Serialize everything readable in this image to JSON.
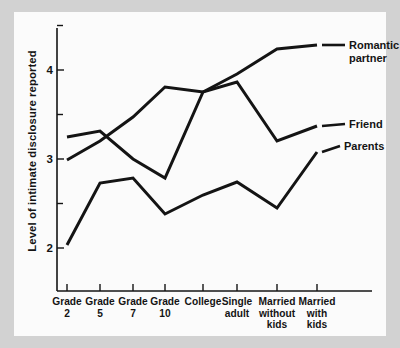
{
  "figure": {
    "background_color": "#d2d2d2",
    "plate_color": "#fbfbfb",
    "line_color": "#141414"
  },
  "chart_data": {
    "type": "line",
    "title": "",
    "xlabel": "",
    "ylabel": "Level of intimate disclosure reported",
    "categories": [
      "Grade 2",
      "Grade 5",
      "Grade 7",
      "Grade 10",
      "College",
      "Single adult",
      "Married without kids",
      "Married with kids"
    ],
    "category_lines": [
      [
        "Grade",
        "2"
      ],
      [
        "Grade",
        "5"
      ],
      [
        "Grade",
        "7"
      ],
      [
        "Grade",
        "10"
      ],
      [
        "College",
        ""
      ],
      [
        "Single",
        "adult"
      ],
      [
        "Married",
        "without",
        "kids"
      ],
      [
        "Married",
        "with",
        "kids"
      ]
    ],
    "ytick_labels": [
      "2",
      "3",
      "4"
    ],
    "ytick_values": [
      2,
      3,
      4
    ],
    "yminor_values": [
      2.5,
      3.5,
      4.5
    ],
    "ylim": [
      1.55,
      4.72
    ],
    "grid": false,
    "legend_position": "right-inline",
    "series": [
      {
        "name": "Romantic partner",
        "label_lines": [
          "Romantic",
          "partner"
        ],
        "values": [
          3.21,
          3.42,
          2.78,
          2.22,
          2.42,
          null,
          null,
          null
        ]
      },
      {
        "name": "Friend",
        "label_lines": [
          "Friend"
        ],
        "values": [
          2.85,
          3.22,
          3.55,
          3.78,
          3.7,
          3.85,
          3.17,
          3.45
        ]
      },
      {
        "name": "Parents",
        "label_lines": [
          "Parents"
        ],
        "values": [
          2.05,
          2.72,
          2.78,
          2.22,
          2.55,
          2.72,
          2.45,
          3.1
        ]
      }
    ],
    "series_paths": {
      "romantic_partner": [
        [
          67,
          137
        ],
        [
          100,
          131
        ],
        [
          133,
          159
        ],
        [
          165,
          178
        ],
        [
          203,
          92
        ],
        [
          237,
          74
        ],
        [
          277,
          49
        ],
        [
          317,
          45
        ]
      ],
      "friend": [
        [
          67,
          160
        ],
        [
          100,
          141
        ],
        [
          133,
          117
        ],
        [
          165,
          87
        ],
        [
          203,
          92
        ],
        [
          237,
          82
        ],
        [
          277,
          141
        ],
        [
          317,
          126
        ]
      ],
      "parents": [
        [
          67,
          245
        ],
        [
          100,
          183
        ],
        [
          133,
          178
        ],
        [
          165,
          214
        ],
        [
          203,
          195
        ],
        [
          237,
          182
        ],
        [
          277,
          208
        ],
        [
          317,
          152
        ]
      ]
    },
    "axis_pixels": {
      "x_ticks": [
        67,
        100,
        133,
        165,
        203,
        237,
        277,
        317
      ],
      "y_map": {
        "2": 248,
        "3": 155,
        "4": 70
      },
      "axis_left_x": 57,
      "axis_bottom_y": 291,
      "axis_top_y": 28,
      "axis_right_x": 372
    },
    "legend_labels": {
      "romantic_partner_leader": [
        [
          322,
          45
        ],
        [
          345,
          45
        ]
      ],
      "friend_leader": [
        [
          322,
          126
        ],
        [
          345,
          124
        ]
      ],
      "parents_leader": [
        [
          322,
          152
        ],
        [
          340,
          146
        ]
      ]
    }
  }
}
